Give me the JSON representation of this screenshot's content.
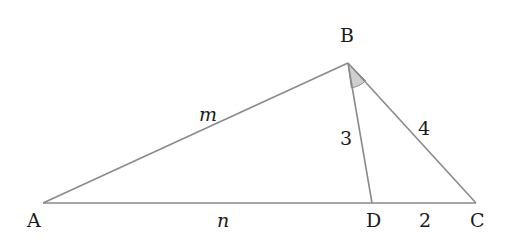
{
  "diagram": {
    "type": "triangle-with-cevian",
    "colors": {
      "line": "#8a8a8a",
      "angle_fill": "#cfcfcf",
      "text": "#1a1a1a",
      "background": "#ffffff"
    },
    "vertices": {
      "A": {
        "label": "A",
        "x": 43,
        "y": 203
      },
      "B": {
        "label": "B",
        "x": 348,
        "y": 63
      },
      "C": {
        "label": "C",
        "x": 476,
        "y": 203
      },
      "D": {
        "label": "D",
        "x": 372,
        "y": 203
      }
    },
    "segments": [
      {
        "from": "A",
        "to": "B",
        "label": "m"
      },
      {
        "from": "A",
        "to": "D",
        "label": "n"
      },
      {
        "from": "B",
        "to": "D",
        "label": "3"
      },
      {
        "from": "B",
        "to": "C",
        "label": "4"
      },
      {
        "from": "D",
        "to": "C",
        "label": "2"
      }
    ],
    "angle_marks": [
      {
        "vertex": "B",
        "between": [
          "D",
          "C"
        ],
        "shaded": true
      }
    ],
    "labels": {
      "A": "A",
      "B": "B",
      "C": "C",
      "D": "D",
      "m": "m",
      "n": "n",
      "bd": "3",
      "bc": "4",
      "dc": "2"
    }
  }
}
